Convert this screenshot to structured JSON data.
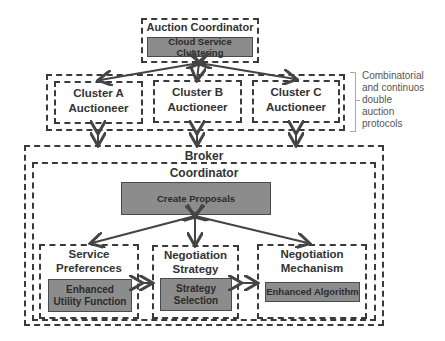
{
  "auction_coordinator": {
    "title": "Auction Coordinator",
    "component": "Cloud Service Clustering"
  },
  "auctioneers": [
    {
      "line1": "Cluster A",
      "line2": "Auctioneer"
    },
    {
      "line1": "Cluster B",
      "line2": "Auctioneer"
    },
    {
      "line1": "Cluster C",
      "line2": "Auctioneer"
    }
  ],
  "protocol_note": [
    "Combinatorial",
    "and continuos",
    "double",
    "auction",
    "protocols"
  ],
  "broker": {
    "title": "Broker",
    "coordinator": {
      "title": "Coordinator",
      "create_proposals": "Create Proposals",
      "modules": [
        {
          "title1": "Service",
          "title2": "Preferences",
          "component1": "Enhanced",
          "component2": "Utility Function"
        },
        {
          "title1": "Negotiation",
          "title2": "Strategy",
          "component1": "Strategy",
          "component2": "Selection"
        },
        {
          "title1": "Negotiation",
          "title2": "Mechanism",
          "component1": "Enhanced Algorithm",
          "component2": ""
        }
      ]
    }
  },
  "colors": {
    "component_fill": "#8c8c8c",
    "border": "#3a3a3a",
    "arrow": "#444444"
  }
}
